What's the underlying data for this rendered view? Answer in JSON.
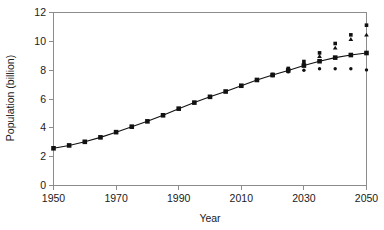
{
  "chart_data": {
    "type": "line",
    "title": "",
    "subtitle": "",
    "xlabel": "Year",
    "ylabel": "Population (billion)",
    "xlim": [
      1950,
      2050
    ],
    "ylim": [
      0,
      12
    ],
    "xticks": [
      1950,
      1970,
      1990,
      2010,
      2030,
      2050
    ],
    "yticks": [
      0,
      2,
      4,
      6,
      8,
      10,
      12
    ],
    "xtick_labels": [
      "1950",
      "1970",
      "1990",
      "2010",
      "2030",
      "2050"
    ],
    "ytick_labels": [
      "0",
      "2",
      "4",
      "6",
      "8",
      "10",
      "12"
    ],
    "grid": false,
    "legend": "none",
    "annotations": [],
    "x": [
      1950,
      1955,
      1960,
      1965,
      1970,
      1975,
      1980,
      1985,
      1990,
      1995,
      2000,
      2005,
      2010,
      2015,
      2020,
      2025,
      2030,
      2035,
      2040,
      2045,
      2050
    ],
    "series": [
      {
        "name": "medium-variant",
        "marker": "square",
        "line": true,
        "values": [
          2.58,
          2.78,
          3.03,
          3.34,
          3.7,
          4.08,
          4.45,
          4.87,
          5.33,
          5.75,
          6.15,
          6.52,
          6.92,
          7.32,
          7.66,
          7.98,
          8.32,
          8.62,
          8.87,
          9.05,
          9.19
        ]
      },
      {
        "name": "high-variant",
        "marker": "square",
        "line": false,
        "values": [
          null,
          null,
          null,
          null,
          null,
          null,
          null,
          null,
          null,
          null,
          null,
          null,
          null,
          null,
          7.7,
          8.12,
          8.6,
          9.2,
          9.85,
          10.45,
          11.12
        ]
      },
      {
        "name": "upper-intermediate-variant",
        "marker": "triangle",
        "line": false,
        "values": [
          null,
          null,
          null,
          null,
          null,
          null,
          null,
          null,
          null,
          null,
          null,
          null,
          null,
          null,
          7.68,
          8.06,
          8.48,
          8.97,
          9.55,
          10.15,
          10.45
        ]
      },
      {
        "name": "low-variant",
        "marker": "circle",
        "line": false,
        "values": [
          null,
          null,
          null,
          null,
          null,
          null,
          null,
          null,
          null,
          null,
          null,
          null,
          null,
          null,
          7.62,
          7.88,
          8.0,
          8.1,
          8.1,
          8.1,
          8.02
        ]
      }
    ]
  },
  "figure": {
    "background_color": "#ffffff",
    "axis_color": "#8c8c8c",
    "data_color": "#111111"
  }
}
